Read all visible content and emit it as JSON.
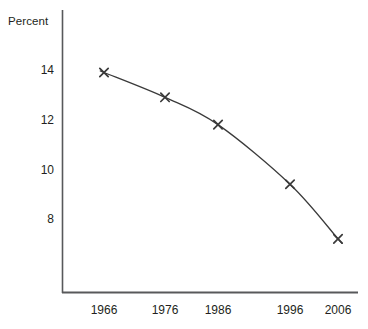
{
  "chart_data": {
    "type": "line",
    "title": "",
    "subtitle": "",
    "xlabel": "",
    "ylabel": "Percent",
    "x": [
      1966,
      1976,
      1986,
      1996,
      2006
    ],
    "categories": [
      "1966",
      "1976",
      "1986",
      "1996",
      "2006"
    ],
    "values": [
      13.9,
      12.9,
      11.8,
      9.4,
      7.2
    ],
    "series": [
      {
        "name": "Percent",
        "values": [
          13.9,
          12.9,
          11.8,
          9.4,
          7.2
        ],
        "marker": "x",
        "color": "#3a3a3a"
      }
    ],
    "xlim": [
      1960,
      2010
    ],
    "ylim": [
      6.6,
      14.8
    ],
    "yticks": [
      8,
      10,
      12,
      14
    ],
    "ytick_labels": [
      "8",
      "10",
      "12",
      "14"
    ],
    "xticks": [
      1966,
      1976,
      1986,
      1996,
      2006
    ],
    "xtick_labels": [
      "1966",
      "1976",
      "1986",
      "1996",
      "2006"
    ],
    "grid": false,
    "legend": false,
    "legend_position": "none",
    "annotations": [],
    "axis_color": "#58595b",
    "line_color": "#3a3a3a",
    "background": "#ffffff"
  },
  "labels": {
    "y_axis_title": "Percent",
    "ytick_0": "14",
    "ytick_1": "12",
    "ytick_2": "10",
    "ytick_3": "8",
    "xtick_0": "1966",
    "xtick_1": "1976",
    "xtick_2": "1986",
    "xtick_3": "1996",
    "xtick_4": "2006"
  }
}
